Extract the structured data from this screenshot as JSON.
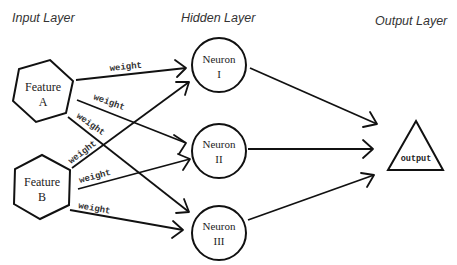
{
  "layers": {
    "input": {
      "title": "Input Layer"
    },
    "hidden": {
      "title": "Hidden Layer"
    },
    "output": {
      "title": "Output Layer"
    }
  },
  "input_nodes": [
    {
      "id": "A",
      "line1": "Feature",
      "line2": "A",
      "shape": "hexagon"
    },
    {
      "id": "B",
      "line1": "Feature",
      "line2": "B",
      "shape": "hexagon"
    }
  ],
  "hidden_nodes": [
    {
      "id": "N1",
      "line1": "Neuron",
      "line2": "I",
      "shape": "circle"
    },
    {
      "id": "N2",
      "line1": "Neuron",
      "line2": "II",
      "shape": "circle"
    },
    {
      "id": "N3",
      "line1": "Neuron",
      "line2": "III",
      "shape": "circle"
    }
  ],
  "output_node": {
    "label": "output",
    "shape": "triangle"
  },
  "edges": [
    {
      "from": "A",
      "to": "N1",
      "label": "weight"
    },
    {
      "from": "A",
      "to": "N2",
      "label": "weight"
    },
    {
      "from": "A",
      "to": "N3",
      "label": "weight"
    },
    {
      "from": "B",
      "to": "N1",
      "label": "weight"
    },
    {
      "from": "B",
      "to": "N2",
      "label": "weight"
    },
    {
      "from": "B",
      "to": "N3",
      "label": "weight"
    },
    {
      "from": "N1",
      "to": "output",
      "label": ""
    },
    {
      "from": "N2",
      "to": "output",
      "label": ""
    },
    {
      "from": "N3",
      "to": "output",
      "label": ""
    }
  ],
  "colors": {
    "stroke": "#111111",
    "text": "#333333",
    "background": "#ffffff"
  }
}
